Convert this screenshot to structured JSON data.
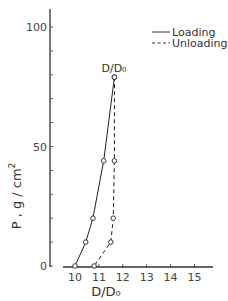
{
  "chart_data": {
    "type": "line",
    "title": "",
    "xlabel": "D/D₀",
    "ylabel": "P , g / cm²",
    "xlim": [
      9.5,
      15.8
    ],
    "ylim": [
      0,
      110
    ],
    "x_ticks": [
      10,
      11,
      12,
      13,
      14,
      15
    ],
    "x_tick_labels": [
      "10",
      "11",
      "12",
      "13",
      "14",
      "15"
    ],
    "y_ticks": [
      0,
      10,
      20,
      30,
      40,
      50,
      60,
      70,
      80,
      90,
      100
    ],
    "y_tick_labels": [
      "0",
      "50",
      "100"
    ],
    "y_labeled_ticks": [
      0,
      50,
      100
    ],
    "grid": false,
    "legend_position": "upper right",
    "annotations": [
      {
        "text": "D/D₀",
        "x": 11.65,
        "y": 79
      }
    ],
    "series": [
      {
        "name": "Loading",
        "style": "solid",
        "x": [
          10.0,
          10.45,
          10.75,
          11.2,
          11.65
        ],
        "y": [
          0,
          10,
          20,
          44,
          79
        ]
      },
      {
        "name": "Unloading",
        "style": "dashed",
        "x": [
          11.65,
          11.65,
          11.6,
          11.5,
          10.8
        ],
        "y": [
          79,
          44,
          20,
          10,
          0
        ]
      }
    ]
  },
  "legend": {
    "loading": "Loading",
    "unloading": "Unloading"
  },
  "labels": {
    "x_axis": "D/D₀",
    "y_axis_main": "P ,  g / cm",
    "y_axis_sup": "2",
    "annotation": "D/D₀"
  },
  "colors": {
    "line": "#222222",
    "axis": "#333333"
  }
}
